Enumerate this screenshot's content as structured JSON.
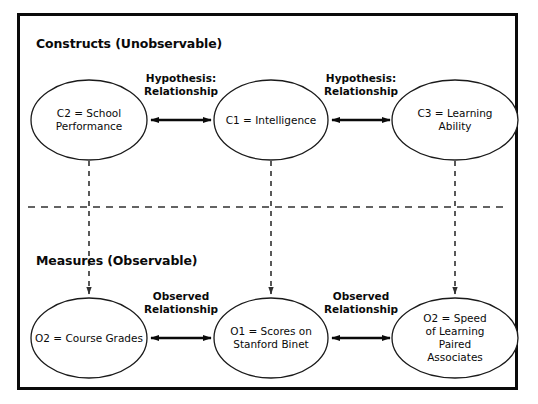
{
  "diagram": {
    "sections": {
      "top": {
        "title": "Constructs (Unobservable)"
      },
      "bottom": {
        "title": "Measures (Observable)"
      }
    },
    "nodes": {
      "c2": {
        "id": "C2",
        "label": "C2 = School\nPerformance",
        "cx": 89,
        "cy": 120,
        "rx": 58,
        "ry": 40
      },
      "c1": {
        "id": "C1",
        "label": "C1 = Intelligence",
        "cx": 271,
        "cy": 120,
        "rx": 57,
        "ry": 40
      },
      "c3": {
        "id": "C3",
        "label": "C3 = Learning Ability",
        "cx": 455,
        "cy": 120,
        "rx": 63,
        "ry": 40
      },
      "o2a": {
        "id": "O2",
        "label": "O2 = Course Grades",
        "cx": 89,
        "cy": 338,
        "rx": 58,
        "ry": 40
      },
      "o1": {
        "id": "O1",
        "label": "O1 = Scores on\nStanford Binet",
        "cx": 271,
        "cy": 338,
        "rx": 57,
        "ry": 40
      },
      "o2b": {
        "id": "O2",
        "label": "O2 = Speed\nof Learning\nPaired Associates",
        "cx": 455,
        "cy": 338,
        "rx": 63,
        "ry": 40
      }
    },
    "edges": {
      "hypothesis_left": {
        "label": "Hypothesis:\nRelationship",
        "type": "double-arrow",
        "x1": 150,
        "x2": 212,
        "y": 120,
        "label_x": 181,
        "label_y": 72
      },
      "hypothesis_right": {
        "label": "Hypothesis:\nRelationship",
        "type": "double-arrow",
        "x1": 331,
        "x2": 391,
        "y": 120,
        "label_x": 361,
        "label_y": 72
      },
      "observed_left": {
        "label": "Observed\nRelationship",
        "type": "double-arrow",
        "x1": 150,
        "x2": 212,
        "y": 338,
        "label_x": 181,
        "label_y": 290
      },
      "observed_right": {
        "label": "Observed\nRelationship",
        "type": "double-arrow",
        "x1": 331,
        "x2": 391,
        "y": 338,
        "label_x": 361,
        "label_y": 290
      },
      "map_c2_o2": {
        "type": "dashed-arrow-down",
        "x": 89,
        "y1": 161,
        "y2": 296
      },
      "map_c1_o1": {
        "type": "dashed-arrow-down",
        "x": 271,
        "y1": 161,
        "y2": 296
      },
      "map_c3_o2b": {
        "type": "dashed-arrow-down",
        "x": 455,
        "y1": 161,
        "y2": 296
      }
    },
    "divider": {
      "type": "dashed-line",
      "x1": 28,
      "x2": 508,
      "y": 207
    },
    "colors": {
      "frame": "#0a0a0a",
      "node_stroke": "#1a1a1a",
      "arrow": "#0a0a0a",
      "dashed": "#404040",
      "background": "#ffffff",
      "text": "#0a0a0a"
    }
  }
}
